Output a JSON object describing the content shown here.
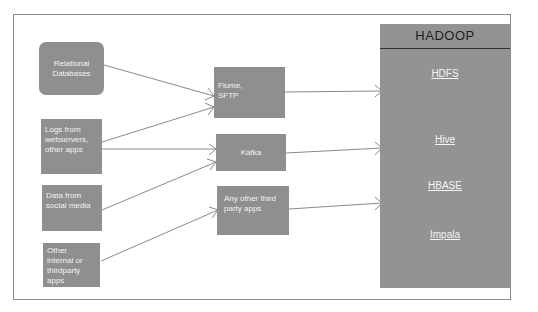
{
  "diagram": {
    "sources": [
      {
        "id": "relational",
        "lines": [
          "Relational",
          "Databases"
        ]
      },
      {
        "id": "logs",
        "lines": [
          "Logs from",
          "webservers,",
          "other apps"
        ]
      },
      {
        "id": "social",
        "lines": [
          "Data from",
          "social media"
        ]
      },
      {
        "id": "other",
        "lines": [
          "Other",
          "internal or",
          "thirdparty",
          "apps"
        ]
      }
    ],
    "ingestion": [
      {
        "id": "flume",
        "lines": [
          "Flume,",
          "SFTP"
        ]
      },
      {
        "id": "kafka",
        "lines": [
          "Kafka"
        ]
      },
      {
        "id": "thirdparty",
        "lines": [
          "Any other third",
          "party apps"
        ]
      }
    ],
    "hadoop": {
      "title": "HADOOP",
      "components": [
        "HDFS",
        "Hive",
        "HBASE",
        "Impala"
      ]
    },
    "edges": [
      {
        "from": "Relational Databases",
        "to": "Flume, SFTP"
      },
      {
        "from": "Logs from webservers, other apps",
        "to": "Flume, SFTP"
      },
      {
        "from": "Logs from webservers, other apps",
        "to": "Kafka"
      },
      {
        "from": "Data from social media",
        "to": "Kafka"
      },
      {
        "from": "Other internal or thirdparty apps",
        "to": "Any other third party apps"
      },
      {
        "from": "Flume, SFTP",
        "to": "HADOOP"
      },
      {
        "from": "Kafka",
        "to": "HADOOP"
      },
      {
        "from": "Any other third party apps",
        "to": "HADOOP"
      }
    ],
    "colors": {
      "box_fill": "#8f8f8f",
      "box_text": "#f2f2f2",
      "hadoop_fill": "#939393",
      "line": "#8a8a8a",
      "frame": "#8c8c8c"
    }
  }
}
